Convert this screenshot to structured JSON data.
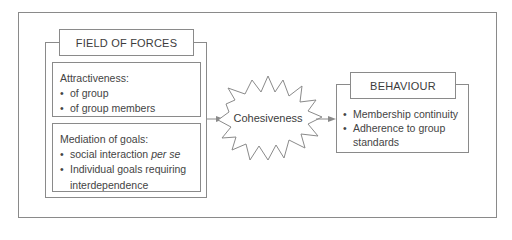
{
  "diagram": {
    "left_group": {
      "header": "FIELD OF FORCES",
      "attractiveness": {
        "title": "Attractiveness:",
        "items": [
          "of group",
          "of group members"
        ]
      },
      "mediation": {
        "title": "Mediation of goals:",
        "item1_plain": "social interaction ",
        "item1_italic": "per se",
        "item2_line1": "Individual goals requiring",
        "item2_line2": "interdependence"
      }
    },
    "center": {
      "label": "Cohesiveness",
      "shape": "starburst"
    },
    "right_group": {
      "header": "BEHAVIOUR",
      "items_line1": "Membership continuity",
      "items_line2a": "Adherence to group",
      "items_line2b": "standards"
    },
    "colors": {
      "line": "#8a8a8a",
      "text": "#444444",
      "background": "#ffffff"
    }
  }
}
